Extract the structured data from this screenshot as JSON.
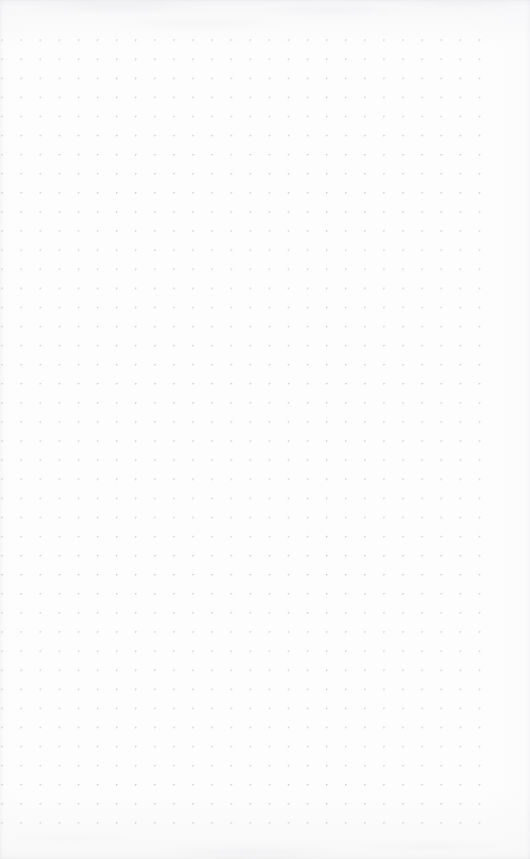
{
  "page": {
    "kind": "dot-grid-notebook-page",
    "width": 530,
    "height": 859,
    "background_color": "#fdfdfd",
    "has_text": false,
    "has_ui_chrome": false,
    "content_note": ""
  },
  "grid": {
    "dot_color": "#c9c9ce",
    "dot_diameter_px": 1.2,
    "spacing_x_px": 19.1,
    "spacing_y_px": 19.1,
    "origin_x_px": 2,
    "origin_y_px": 40,
    "columns": 26,
    "rows": 42,
    "last_column_x_px": 485,
    "last_row_y_px": 838,
    "margin_top_px": 30,
    "margin_bottom_px": 21,
    "margin_left_px": 0,
    "margin_right_px": 45
  },
  "artifacts": {
    "scan_tint_color": "#f6f6f8",
    "vignette_color": "#bebec6",
    "top_smudge_visible": true,
    "bottom_smudge_visible": true
  }
}
